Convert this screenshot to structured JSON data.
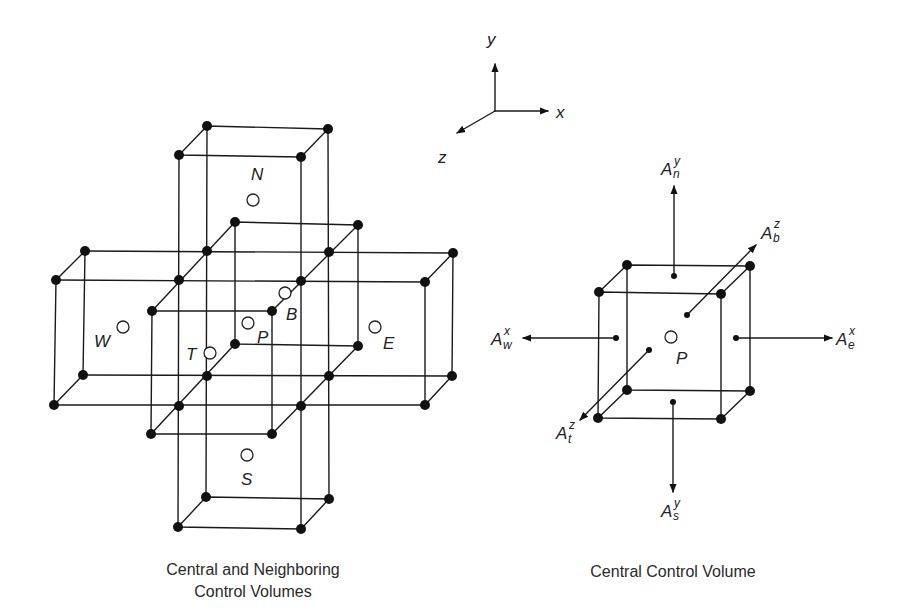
{
  "figure": {
    "axes": {
      "x_label": "x",
      "y_label": "y",
      "z_label": "z"
    },
    "left_panel": {
      "caption_line1": "Central and Neighboring",
      "caption_line2": "Control Volumes",
      "nodes": {
        "N": "N",
        "S": "S",
        "W": "W",
        "E": "E",
        "P": "P",
        "T": "T",
        "B": "B"
      }
    },
    "right_panel": {
      "caption": "Central Control Volume",
      "center_label": "P",
      "face_areas": [
        {
          "id": "north",
          "base": "A",
          "sup": "y",
          "sub": "n"
        },
        {
          "id": "south",
          "base": "A",
          "sup": "y",
          "sub": "s"
        },
        {
          "id": "west",
          "base": "A",
          "sup": "x",
          "sub": "w"
        },
        {
          "id": "east",
          "base": "A",
          "sup": "x",
          "sub": "e"
        },
        {
          "id": "bottom",
          "base": "A",
          "sup": "z",
          "sub": "b"
        },
        {
          "id": "top",
          "base": "A",
          "sup": "z",
          "sub": "t"
        }
      ]
    },
    "colors": {
      "ink": "#1a1a1a",
      "background": "#ffffff"
    }
  }
}
